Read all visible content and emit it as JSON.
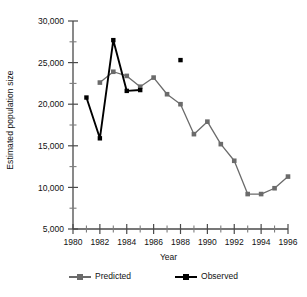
{
  "chart_data": {
    "type": "line",
    "title": "",
    "xlabel": "Year",
    "ylabel": "Estimated population size",
    "xlim": [
      1980,
      1996
    ],
    "ylim": [
      5000,
      30000
    ],
    "xticks": [
      1980,
      1982,
      1984,
      1986,
      1988,
      1990,
      1992,
      1994,
      1996
    ],
    "xtick_labels": [
      "1980",
      "1982",
      "1984",
      "1986",
      "1988",
      "1990",
      "1992",
      "1994",
      "1996"
    ],
    "xminor_step": 1,
    "yticks": [
      5000,
      10000,
      15000,
      20000,
      25000,
      30000
    ],
    "ytick_labels": [
      "5,000",
      "10,000",
      "15,000",
      "20,000",
      "25,000",
      "30,000"
    ],
    "yminor_step": 2500,
    "grid": false,
    "legend_position": "bottom",
    "series": [
      {
        "name": "Predicted",
        "color": "#6b6b6b",
        "marker": "square",
        "x": [
          1982,
          1983,
          1984,
          1985,
          1986,
          1987,
          1988,
          1989,
          1990,
          1991,
          1992,
          1993,
          1994,
          1995,
          1996
        ],
        "values": [
          22600,
          23900,
          23400,
          22100,
          23200,
          21200,
          20000,
          16400,
          17900,
          15200,
          13200,
          9200,
          9200,
          9900,
          11300
        ]
      },
      {
        "name": "Observed",
        "color": "#000000",
        "marker": "square",
        "x": [
          1981,
          1982,
          1983,
          1984,
          1985
        ],
        "values": [
          20800,
          15900,
          27700,
          21600,
          21700
        ]
      },
      {
        "name": "Observed isolated point",
        "color": "#000000",
        "marker": "square",
        "connected": false,
        "x": [
          1988
        ],
        "values": [
          25300
        ]
      }
    ]
  },
  "legend": {
    "entries": [
      {
        "label": "Predicted",
        "color": "#6b6b6b"
      },
      {
        "label": "Observed",
        "color": "#000000"
      }
    ]
  },
  "axes": {
    "x_title": "Year",
    "y_title": "Estimated population size"
  }
}
